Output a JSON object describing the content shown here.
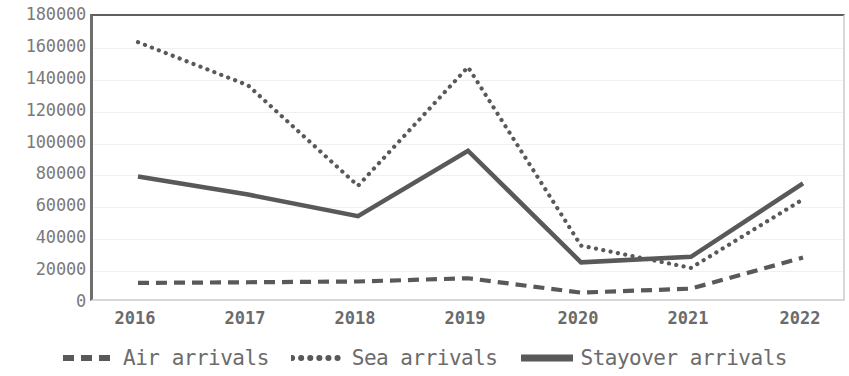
{
  "chart_data": {
    "type": "line",
    "title": "",
    "xlabel": "",
    "ylabel": "",
    "categories": [
      "2016",
      "2017",
      "2018",
      "2019",
      "2020",
      "2021",
      "2022"
    ],
    "ylim": [
      0,
      180000
    ],
    "ytick_step": 20000,
    "yticks": [
      "180000",
      "160000",
      "140000",
      "120000",
      "100000",
      "80000",
      "60000",
      "40000",
      "20000",
      "0"
    ],
    "ytick_values": [
      180000,
      160000,
      140000,
      120000,
      100000,
      80000,
      60000,
      40000,
      20000,
      0
    ],
    "grid": true,
    "legend_position": "bottom",
    "series": [
      {
        "name": "Air arrivals",
        "style": "dashed",
        "color": "#595959",
        "values": [
          12600,
          13000,
          13500,
          15500,
          6500,
          9000,
          28500
        ]
      },
      {
        "name": "Sea arrivals",
        "style": "dotted",
        "color": "#595959",
        "values": [
          163600,
          136500,
          73500,
          148000,
          36000,
          22000,
          65000
        ]
      },
      {
        "name": "Stayover arrivals",
        "style": "solid",
        "color": "#595959",
        "values": [
          79300,
          68000,
          54500,
          95500,
          25500,
          29000,
          75000
        ]
      }
    ]
  },
  "legend": {
    "items": [
      {
        "label": "Air arrivals",
        "swatch": "dashed-line-swatch"
      },
      {
        "label": "Sea arrivals",
        "swatch": "dotted-line-swatch"
      },
      {
        "label": "Stayover arrivals",
        "swatch": "solid-line-swatch"
      }
    ]
  }
}
